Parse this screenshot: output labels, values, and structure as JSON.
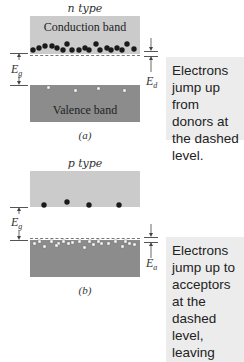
{
  "panel_a": {
    "title": "n type",
    "conduction_band_label": "Conduction band",
    "valence_band_label": "Valence band",
    "caption": "(a)",
    "gap_symbol": "E",
    "gap_subscript": "g",
    "level_symbol": "E",
    "level_subscript": "d",
    "note": "Electrons jump up from donors at the dashed level.",
    "electron_count": 19,
    "hole_count": 4
  },
  "panel_b": {
    "title": "p type",
    "caption": "(b)",
    "gap_symbol": "E",
    "gap_subscript": "g",
    "level_symbol": "E",
    "level_subscript": "a",
    "note": "Electrons jump up to acceptors at the dashed level, leaving holes.",
    "electron_count": 4,
    "hole_count": 21
  },
  "colors": {
    "conduction_band": "#cbcbcb",
    "valence_band": "#8c8c8c",
    "note_background": "#ececec",
    "electron": "#1a1a1a",
    "hole": "#ffffff"
  }
}
